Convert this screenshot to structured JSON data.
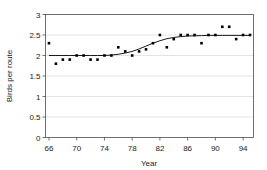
{
  "chart_data": {
    "type": "scatter",
    "title": "",
    "xlabel": "Year",
    "ylabel": "Birds per route",
    "xlim": [
      65.5,
      95.5
    ],
    "ylim": [
      0,
      3
    ],
    "grid": true,
    "legend": "none",
    "xticks": [
      66,
      70,
      74,
      78,
      82,
      86,
      90,
      94
    ],
    "xtick_labels": [
      "66",
      "70",
      "74",
      "78",
      "82",
      "86",
      "90",
      "94"
    ],
    "yticks": [
      0,
      0.5,
      1,
      1.5,
      2,
      2.5,
      3
    ],
    "ytick_labels": [
      "0",
      "0.5",
      "1",
      "1.5",
      "2",
      "2.5",
      "3"
    ],
    "x": [
      66,
      67,
      68,
      69,
      70,
      71,
      72,
      73,
      74,
      75,
      76,
      77,
      78,
      79,
      80,
      81,
      82,
      83,
      84,
      85,
      86,
      87,
      88,
      89,
      90,
      91,
      92,
      93,
      94,
      95
    ],
    "values": [
      2.3,
      1.8,
      1.9,
      1.9,
      2.0,
      2.0,
      1.9,
      1.9,
      2.0,
      2.0,
      2.2,
      2.1,
      2.0,
      2.1,
      2.15,
      2.3,
      2.5,
      2.2,
      2.4,
      2.5,
      2.5,
      2.5,
      2.3,
      2.5,
      2.5,
      2.7,
      2.7,
      2.4,
      2.5,
      2.5
    ],
    "series": [
      {
        "name": "Birds per route",
        "marker": "square",
        "values": [
          2.3,
          1.8,
          1.9,
          1.9,
          2.0,
          2.0,
          1.9,
          1.9,
          2.0,
          2.0,
          2.2,
          2.1,
          2.0,
          2.1,
          2.15,
          2.3,
          2.5,
          2.2,
          2.4,
          2.5,
          2.5,
          2.5,
          2.3,
          2.5,
          2.5,
          2.7,
          2.7,
          2.4,
          2.5,
          2.5
        ]
      },
      {
        "name": "fitted trend",
        "type": "line",
        "x": [
          66,
          67,
          68,
          69,
          70,
          71,
          72,
          73,
          74,
          75,
          76,
          77,
          78,
          79,
          80,
          81,
          82,
          83,
          84,
          85,
          86,
          87,
          88,
          89,
          90,
          91,
          92,
          93,
          94,
          95
        ],
        "values": [
          2.0,
          2.0,
          2.0,
          2.0,
          2.0,
          2.0,
          2.0,
          2.0,
          2.0,
          2.01,
          2.03,
          2.06,
          2.1,
          2.16,
          2.23,
          2.3,
          2.36,
          2.41,
          2.44,
          2.46,
          2.475,
          2.48,
          2.485,
          2.49,
          2.49,
          2.49,
          2.49,
          2.49,
          2.49,
          2.49
        ]
      }
    ]
  }
}
